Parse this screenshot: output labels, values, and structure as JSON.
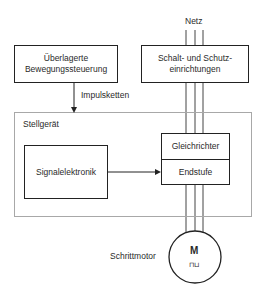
{
  "diagram": {
    "supply": {
      "label": "Netz"
    },
    "motion_control": {
      "line1": "Überlagerte",
      "line2": "Bewegungssteuerung"
    },
    "protection": {
      "line1": "Schalt- und Schutz-",
      "line2": "einrichtungen"
    },
    "pulse_signal": {
      "label": "Impulsketten"
    },
    "actuator": {
      "label": "Stellgerät",
      "signal_electronics": {
        "label": "Signalelektronik"
      },
      "rectifier": {
        "label": "Gleichrichter"
      },
      "output_stage": {
        "label": "Endstufe"
      }
    },
    "motor": {
      "label": "Schrittmotor",
      "symbol": "M",
      "subsymbol": "⊓⊔"
    },
    "colors": {
      "line": "#222222",
      "frame": "#a8a8a8",
      "phase": "#555555"
    }
  }
}
